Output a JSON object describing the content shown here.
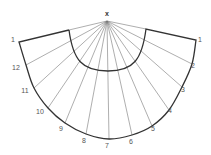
{
  "diagram": {
    "type": "cone-development",
    "apex": {
      "label": "x",
      "x": 107,
      "y": 21,
      "label_x": 107,
      "label_y": 16
    },
    "colors": {
      "outline": "#333333",
      "rays": "#777777",
      "labels": "#555555"
    },
    "outer_points": [
      {
        "label": "1",
        "x": 19,
        "y": 42,
        "lx": 13,
        "ly": 42
      },
      {
        "label": "12",
        "x": 26,
        "y": 65,
        "lx": 16,
        "ly": 70
      },
      {
        "label": "11",
        "x": 34,
        "y": 88,
        "lx": 25,
        "ly": 93
      },
      {
        "label": "10",
        "x": 48,
        "y": 108,
        "lx": 40,
        "ly": 114
      },
      {
        "label": "9",
        "x": 65,
        "y": 123,
        "lx": 61,
        "ly": 131
      },
      {
        "label": "8",
        "x": 86,
        "y": 134,
        "lx": 84,
        "ly": 143
      },
      {
        "label": "7",
        "x": 109,
        "y": 139,
        "lx": 107,
        "ly": 148
      },
      {
        "label": "6",
        "x": 132,
        "y": 135,
        "lx": 131,
        "ly": 144
      },
      {
        "label": "5",
        "x": 152,
        "y": 126,
        "lx": 153,
        "ly": 131
      },
      {
        "label": "4",
        "x": 169,
        "y": 110,
        "lx": 170,
        "ly": 113
      },
      {
        "label": "3",
        "x": 182,
        "y": 87,
        "lx": 183,
        "ly": 92
      },
      {
        "label": "2",
        "x": 192,
        "y": 64,
        "lx": 193,
        "ly": 68
      },
      {
        "label": "1",
        "x": 196,
        "y": 40,
        "lx": 200,
        "ly": 42
      }
    ],
    "inner_arc": {
      "left": {
        "x": 69,
        "y": 30
      },
      "bottom": {
        "x": 108,
        "y": 71
      },
      "right": {
        "x": 146,
        "y": 29
      }
    }
  }
}
